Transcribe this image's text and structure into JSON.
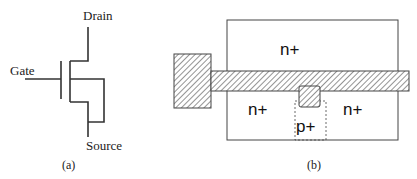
{
  "panel_a": {
    "caption": "(a)",
    "labels": {
      "drain": "Drain",
      "gate": "Gate",
      "source": "Source"
    }
  },
  "panel_b": {
    "caption": "(b)",
    "regions": {
      "top": "n+",
      "left": "n+",
      "right": "n+",
      "body_contact": "p+"
    }
  },
  "colors": {
    "line": "#333333",
    "hatch": "#555555",
    "fill": "#ffffff"
  }
}
